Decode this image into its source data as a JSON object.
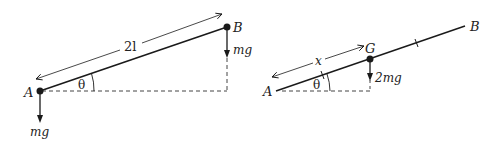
{
  "diagrams": {
    "left": {
      "title": "Rod AB with particles",
      "point_a_label": "A",
      "point_b_label": "B",
      "length_label": "2l",
      "angle_label": "θ",
      "force_a_label": "mg",
      "force_b_label": "mg"
    },
    "right": {
      "title": "Rod AB with centre of mass G",
      "point_a_label": "A",
      "point_b_label": "B",
      "point_g_label": "G",
      "distance_label": "x",
      "angle_label": "θ",
      "force_g_label": "2mg"
    }
  },
  "colors": {
    "line": "#1a1a1a",
    "dashed": "#444444",
    "background": "#ffffff"
  }
}
